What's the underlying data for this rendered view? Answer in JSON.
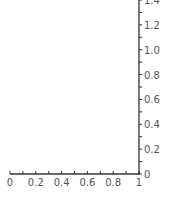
{
  "chart_data": {
    "type": "line",
    "title": "",
    "xlabel": "",
    "ylabel": "",
    "xlim": [
      0,
      1
    ],
    "ylim": [
      0,
      1.4
    ],
    "x_ticks": [
      "0",
      "0.2",
      "0.4",
      "0.6",
      "0.8",
      "1"
    ],
    "y_ticks": [
      "0",
      "0.2",
      "0.4",
      "0.6",
      "0.8",
      "1.0",
      "1.2",
      "1.4"
    ],
    "x_minor_step": 0.1,
    "y_minor_step": 0.1,
    "y_axis_position": "right",
    "grid": false,
    "legend": null,
    "series": []
  },
  "style": {
    "axis_color": "#333333",
    "label_color": "#555555",
    "background": "#ffffff"
  }
}
